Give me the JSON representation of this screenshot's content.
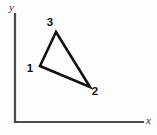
{
  "figure": {
    "background_color": "#fdfdfd",
    "width": 157,
    "height": 135
  },
  "axes": {
    "stroke_color": "#4a4a4a",
    "origin": {
      "x": 15,
      "y": 122
    },
    "x_axis": {
      "label": "x",
      "start_x": 15,
      "end_x": 143,
      "y": 122,
      "label_x": 146,
      "label_y": 124
    },
    "y_axis": {
      "label": "y",
      "x": 15,
      "start_y": 122,
      "end_y": 14,
      "label_x": 9,
      "label_y": 11
    }
  },
  "chart_data": {
    "type": "scatter",
    "title": "",
    "xlabel": "x",
    "ylabel": "y",
    "grid": false,
    "legend": "none",
    "annotations": [
      "1",
      "2",
      "3"
    ],
    "shape": "triangle",
    "points": [
      {
        "label": "1",
        "px": 40,
        "py": 66,
        "label_px": 30,
        "label_py": 72
      },
      {
        "label": "2",
        "px": 90,
        "py": 87,
        "label_px": 95,
        "label_py": 95
      },
      {
        "label": "3",
        "px": 56,
        "py": 32,
        "label_px": 50,
        "label_py": 26
      }
    ],
    "polygon_order": [
      "1",
      "3",
      "2"
    ],
    "stroke_color": "#121212"
  }
}
